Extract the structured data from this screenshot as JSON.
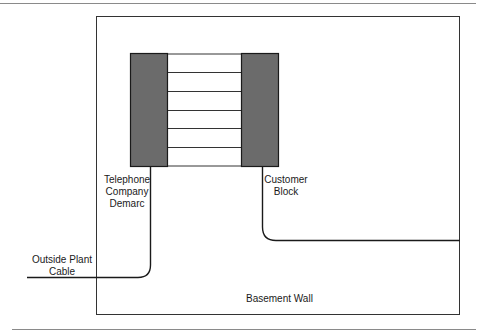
{
  "diagram": {
    "type": "wiring-diagram",
    "colors": {
      "block_fill": "#6b6b6b",
      "line": "#1a1a1a",
      "rule": "#8a8a8a",
      "background": "#ffffff"
    },
    "labels": {
      "telco_demarc": [
        "Telephone",
        "Company",
        "Demarc"
      ],
      "customer_block": [
        "Customer",
        "Block"
      ],
      "outside_plant": [
        "Outside Plant",
        "Cable"
      ],
      "basement_wall": "Basement Wall"
    },
    "cross_connect_pairs": 6
  }
}
